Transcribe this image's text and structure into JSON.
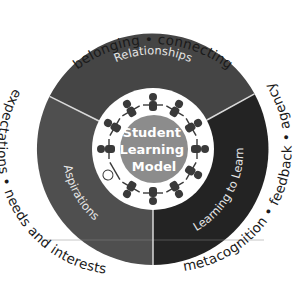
{
  "diagram": {
    "title": "Student Learning Model",
    "center": {
      "lines": [
        "Student",
        "Learning",
        "Model"
      ]
    },
    "segments": [
      {
        "id": "relationships",
        "label": "Relationships",
        "color": "#454545",
        "descriptors_text": "belonging • connecting",
        "descriptors": [
          "belonging",
          "connecting"
        ]
      },
      {
        "id": "learning-to-learn",
        "label": "Learning to Learn",
        "color": "#232323",
        "descriptors_text": "metacognition • feedback • agency",
        "descriptors": [
          "metacognition",
          "feedback",
          "agency"
        ]
      },
      {
        "id": "aspirations",
        "label": "Aspirations",
        "color": "#4f4f4f",
        "descriptors_text": "expectations • needs and interests",
        "descriptors": [
          "expectations",
          "needs and interests"
        ]
      }
    ],
    "colors": {
      "ring_white": "#ffffff",
      "core_gray": "#8c8c8c",
      "divider": "#d9d9d9",
      "text_dark": "#1a1a1a",
      "label_light": "#e6e6e6"
    },
    "figure_ring": {
      "icon": "children-holding-hands-icon",
      "count": 12
    }
  }
}
